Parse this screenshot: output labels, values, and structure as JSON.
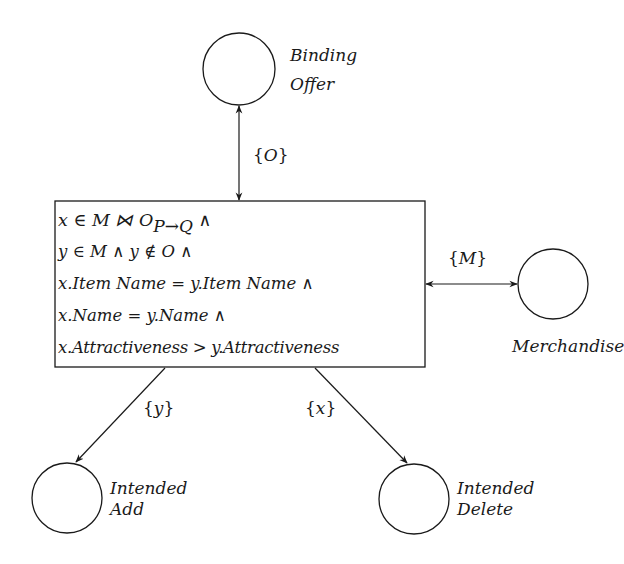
{
  "diagram": {
    "nodes": [
      {
        "id": "binding-offer",
        "label_lines": [
          "Binding",
          "Offer"
        ],
        "shape": "circle"
      },
      {
        "id": "merchandise",
        "label_lines": [
          "Merchandise"
        ],
        "shape": "circle"
      },
      {
        "id": "intended-add",
        "label_lines": [
          "Intended",
          "Add"
        ],
        "shape": "circle"
      },
      {
        "id": "intended-delete",
        "label_lines": [
          "Intended",
          "Delete"
        ],
        "shape": "circle"
      }
    ],
    "transition": {
      "lines": [
        "x ∈ M ⋈ O",
        "P→Q",
        " ∧",
        "y ∈ M  ∧  y ∉ O ∧",
        "x.Item Name = y.Item Name ∧",
        "x.Name = y.Name ∧",
        "x.Attractiveness > y.Attractiveness"
      ]
    },
    "edges": [
      {
        "from": "transition",
        "to": "binding-offer",
        "label": "{O}",
        "label_var": "O",
        "bidirectional": true
      },
      {
        "from": "transition",
        "to": "merchandise",
        "label": "{M}",
        "label_var": "M",
        "bidirectional": true
      },
      {
        "from": "transition",
        "to": "intended-add",
        "label": "{y}",
        "label_var": "y",
        "bidirectional": false
      },
      {
        "from": "transition",
        "to": "intended-delete",
        "label": "{x}",
        "label_var": "x",
        "bidirectional": false
      }
    ],
    "brace_open": "{",
    "brace_close": "}"
  }
}
